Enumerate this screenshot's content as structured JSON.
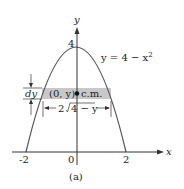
{
  "figure": {
    "caption": "(a)",
    "axes": {
      "x_label": "x",
      "y_label": "y",
      "x_ticks": [
        "-2",
        "0",
        "2"
      ],
      "y_ticks": [
        "4"
      ]
    },
    "curve": {
      "equation_lhs": "y = 4 − x",
      "equation_exp": "2"
    },
    "strip": {
      "thickness_label": "dy",
      "center_label": "(0, y)",
      "cm_label": "c.m.",
      "width_label": "2√4 − y",
      "width_prefix": "2",
      "width_radicand": "4 − y"
    },
    "colors": {
      "curve": "#555555",
      "strip_fill": "#c8c8c8",
      "axis": "#333333"
    }
  }
}
